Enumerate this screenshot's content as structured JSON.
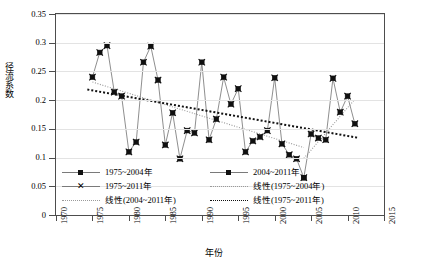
{
  "chart_data": {
    "type": "line",
    "title": "",
    "xlabel": "年份",
    "ylabel": "径流系数",
    "xlim": [
      1970,
      2015
    ],
    "ylim": [
      0,
      0.35
    ],
    "grid": true,
    "legend_position": "inside-bottom-left",
    "x_ticks": [
      "1970",
      "1975",
      "1980",
      "1985",
      "1990",
      "1995",
      "2000",
      "2005",
      "2010",
      "2015"
    ],
    "y_ticks": [
      "0",
      "0.05",
      "0.1",
      "0.15",
      "0.2",
      "0.25",
      "0.3",
      "0.35"
    ],
    "x": [
      1975,
      1976,
      1977,
      1978,
      1979,
      1980,
      1981,
      1982,
      1983,
      1984,
      1985,
      1986,
      1987,
      1988,
      1989,
      1990,
      1991,
      1992,
      1993,
      1994,
      1995,
      1996,
      1997,
      1998,
      1999,
      2000,
      2001,
      2002,
      2003,
      2004,
      2005,
      2006,
      2007,
      2008,
      2009,
      2010,
      2011
    ],
    "series": [
      {
        "name": "1975~2004年",
        "marker": "square",
        "x": [
          1975,
          1976,
          1977,
          1978,
          1979,
          1980,
          1981,
          1982,
          1983,
          1984,
          1985,
          1986,
          1987,
          1988,
          1989,
          1990,
          1991,
          1992,
          1993,
          1994,
          1995,
          1996,
          1997,
          1998,
          1999,
          2000,
          2001,
          2002,
          2003,
          2004
        ],
        "values": [
          0.24,
          0.283,
          0.295,
          0.214,
          0.207,
          0.11,
          0.127,
          0.266,
          0.294,
          0.235,
          0.122,
          0.178,
          0.098,
          0.147,
          0.143,
          0.266,
          0.131,
          0.167,
          0.24,
          0.193,
          0.22,
          0.11,
          0.129,
          0.136,
          0.147,
          0.239,
          0.124,
          0.105,
          0.098,
          0.065
        ]
      },
      {
        "name": "2004~2011年",
        "marker": "square",
        "x": [
          2004,
          2005,
          2006,
          2007,
          2008,
          2009,
          2010,
          2011
        ],
        "values": [
          0.065,
          0.141,
          0.134,
          0.131,
          0.238,
          0.179,
          0.207,
          0.159
        ]
      },
      {
        "name": "1975~2011年",
        "marker": "x",
        "x": [
          1975,
          1976,
          1977,
          1978,
          1979,
          1980,
          1981,
          1982,
          1983,
          1984,
          1985,
          1986,
          1987,
          1988,
          1989,
          1990,
          1991,
          1992,
          1993,
          1994,
          1995,
          1996,
          1997,
          1998,
          1999,
          2000,
          2001,
          2002,
          2003,
          2004,
          2005,
          2006,
          2007,
          2008,
          2009,
          2010,
          2011
        ],
        "values": [
          0.24,
          0.283,
          0.295,
          0.214,
          0.207,
          0.11,
          0.127,
          0.266,
          0.294,
          0.235,
          0.122,
          0.178,
          0.098,
          0.147,
          0.143,
          0.266,
          0.131,
          0.167,
          0.24,
          0.193,
          0.22,
          0.11,
          0.129,
          0.136,
          0.147,
          0.239,
          0.124,
          0.105,
          0.098,
          0.065,
          0.141,
          0.134,
          0.131,
          0.238,
          0.179,
          0.207,
          0.159
        ]
      }
    ],
    "trendlines": [
      {
        "name": "线性(1975~2004年)",
        "style": "dotted-thin",
        "x_start": 1975,
        "y_start": 0.2315,
        "x_end": 2004,
        "y_end": 0.1175
      },
      {
        "name": "线性(2004~2011年)",
        "style": "dotted-thin",
        "x_start": 2004,
        "y_start": 0.0985,
        "x_end": 2011,
        "y_end": 0.2015
      },
      {
        "name": "线性(1975~2011年)",
        "style": "dotted-bold",
        "x_start": 1974.3,
        "y_start": 0.2185,
        "x_end": 2011.4,
        "y_end": 0.1345
      }
    ]
  },
  "legend": {
    "rows": [
      [
        {
          "label": "1975~2004年",
          "key": "line-square-marker"
        },
        {
          "label": "2004~2011年",
          "key": "line-square-marker"
        }
      ],
      [
        {
          "label": "1975~2011年",
          "key": "x-marker"
        },
        {
          "label": "线性(1975~2004年)",
          "key": "dotted-thin-line"
        }
      ],
      [
        {
          "label": "线性(2004~2011年)",
          "key": "dotted-thin-line"
        },
        {
          "label": "线性(1975~2011年)",
          "key": "dotted-bold-line"
        }
      ]
    ]
  },
  "axes": {
    "x_title": "年份",
    "y_title": "径流系数"
  },
  "caption": "",
  "colors": {
    "series_line": "#7a7a7a",
    "marker": "#111111",
    "trend_thin": "#9a9a9a",
    "trend_bold": "#111111",
    "grid": "#e3e3e3",
    "frame": "#4d4d4d"
  }
}
